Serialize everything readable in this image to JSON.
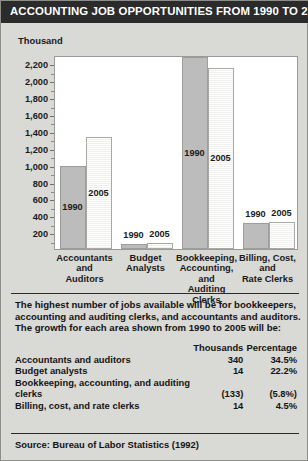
{
  "header": {
    "title": "ACCOUNTING JOB OPPORTUNITIES FROM 1990 TO 2005"
  },
  "chart_data": {
    "type": "bar",
    "title": "ACCOUNTING JOB OPPORTUNITIES FROM 1990 TO 2005",
    "xlabel": "",
    "ylabel": "Thousand",
    "ylim": [
      0,
      2300
    ],
    "yticks": [
      "2,200",
      "2,000",
      "1,800",
      "1,600",
      "1,400",
      "1,200",
      "1,000",
      "800",
      "600",
      "400",
      "200"
    ],
    "ytick_values": [
      2200,
      2000,
      1800,
      1600,
      1400,
      1200,
      1000,
      800,
      600,
      400,
      200
    ],
    "grid": false,
    "legend": "none",
    "categories": [
      "Accountants and Auditors",
      "Budget Analysts",
      "Bookkeeping, Accounting, and Auditing Clerks",
      "Billing, Cost, and Rate Clerks"
    ],
    "category_lines": [
      [
        "Accountants",
        "and",
        "Auditors"
      ],
      [
        "Budget",
        "Analysts"
      ],
      [
        "Bookkeeping,",
        "Accounting,",
        "and",
        "Auditing",
        "Clerks"
      ],
      [
        "Billing, Cost,",
        "and",
        "Rate Clerks"
      ]
    ],
    "series": [
      {
        "name": "1990",
        "values": [
          985,
          63,
          2280,
          311
        ]
      },
      {
        "name": "2005",
        "values": [
          1325,
          77,
          2147,
          325
        ]
      }
    ],
    "series_labels": [
      "1990",
      "2005"
    ]
  },
  "body": {
    "paragraph_lines": [
      "The highest number of jobs available will be for bookkeepers,",
      "accounting and auditing clerks, and accountants and auditors.",
      "The growth for each area shown from 1990 to 2005 will be:"
    ]
  },
  "table": {
    "columns": [
      "",
      "Thousands",
      "Percentage"
    ],
    "rows": [
      {
        "name": "Accountants and auditors",
        "thousands": "340",
        "percentage": "34.5%",
        "indent": false
      },
      {
        "name": "Budget analysts",
        "thousands": "14",
        "percentage": "22.2%",
        "indent": false
      },
      {
        "name": "Bookkeeping, accounting, and auditing",
        "thousands": "",
        "percentage": "",
        "indent": false
      },
      {
        "name": "clerks",
        "thousands": "(133)",
        "percentage": "(5.8%)",
        "indent": true
      },
      {
        "name": "Billing, cost, and rate clerks",
        "thousands": "14",
        "percentage": "4.5%",
        "indent": false
      }
    ]
  },
  "footer": {
    "source": "Source: Bureau of Labor Statistics (1992)"
  }
}
